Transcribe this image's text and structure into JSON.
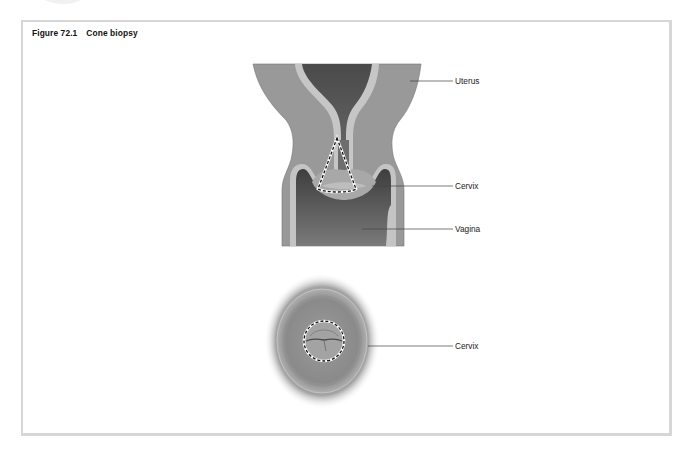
{
  "figure": {
    "number": "Figure 72.1",
    "title": "Cone biopsy"
  },
  "labels": {
    "sagittal": [
      {
        "text": "Uterus"
      },
      {
        "text": "Cervix"
      },
      {
        "text": "Vagina"
      }
    ],
    "frontal": [
      {
        "text": "Cervix"
      }
    ]
  },
  "colors": {
    "frame_border": "#d6d6d6",
    "tissue_outer": "#9a9a9a",
    "tissue_lining": "#c4c4c4",
    "cavity_dark": "#555555",
    "leader_line": "#444444",
    "cone_outline": "#ffffff"
  }
}
